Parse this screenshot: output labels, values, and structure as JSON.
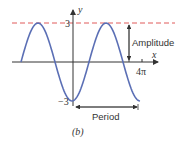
{
  "figure": {
    "caption": "(b)",
    "y_axis_label": "y",
    "x_axis_label": "x",
    "y_max_label": "3",
    "y_min_label": "−3",
    "x_tick_label": "4π",
    "amplitude_label": "Amplitude",
    "period_label": "Period",
    "curve_color": "#5b6fb5",
    "dashed_line_color": "#e05a5a",
    "axis_color": "#333333"
  }
}
